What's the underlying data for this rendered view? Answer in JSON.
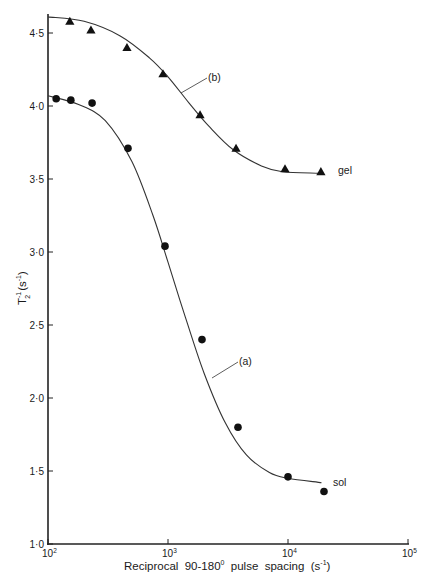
{
  "chart_data": {
    "type": "scatter",
    "title": "",
    "xlabel": "Reciprocal 90-180° pulse spacing (s⁻¹)",
    "xlabel_parts": {
      "main": "Reciprocal  90-180",
      "degree": "0",
      "units_open": "  pulse  spacing  (s",
      "units_exp": "-1",
      "units_close": ")"
    },
    "ylabel": "T₂⁻¹ (s⁻¹)",
    "ylabel_parts": {
      "base": "T",
      "sub": "2",
      "exp": "-1",
      "units": "(s",
      "units_exp": "-1",
      "units_close": ")"
    },
    "xscale": "log",
    "xlim": [
      100,
      100000
    ],
    "ylim": [
      1.0,
      4.6
    ],
    "x_ticks": [
      {
        "value": 100,
        "base": "10",
        "exp": "2"
      },
      {
        "value": 1000,
        "base": "10",
        "exp": "3"
      },
      {
        "value": 10000,
        "base": "10",
        "exp": "4"
      },
      {
        "value": 100000,
        "base": "10",
        "exp": "5"
      }
    ],
    "y_ticks": [
      {
        "value": 1.0,
        "label": "1·0"
      },
      {
        "value": 1.5,
        "label": "1·5"
      },
      {
        "value": 2.0,
        "label": "2·0"
      },
      {
        "value": 2.5,
        "label": "2·5"
      },
      {
        "value": 3.0,
        "label": "3·0"
      },
      {
        "value": 3.5,
        "label": "3·5"
      },
      {
        "value": 4.0,
        "label": "4·0"
      },
      {
        "value": 4.5,
        "label": "4·5"
      }
    ],
    "grid": false,
    "legend": "none",
    "series": [
      {
        "name": "gel",
        "curve_label": "(b)",
        "marker": "triangle",
        "points": [
          {
            "x": 152,
            "y": 4.58
          },
          {
            "x": 228,
            "y": 4.52
          },
          {
            "x": 455,
            "y": 4.4
          },
          {
            "x": 908,
            "y": 4.22
          },
          {
            "x": 1850,
            "y": 3.94
          },
          {
            "x": 3690,
            "y": 3.71
          },
          {
            "x": 9440,
            "y": 3.57
          },
          {
            "x": 18800,
            "y": 3.55
          }
        ],
        "fit_curve": [
          {
            "x": 100,
            "y": 4.61
          },
          {
            "x": 200,
            "y": 4.58
          },
          {
            "x": 400,
            "y": 4.48
          },
          {
            "x": 700,
            "y": 4.33
          },
          {
            "x": 1000,
            "y": 4.2
          },
          {
            "x": 1500,
            "y": 4.02
          },
          {
            "x": 2200,
            "y": 3.86
          },
          {
            "x": 3500,
            "y": 3.7
          },
          {
            "x": 6000,
            "y": 3.59
          },
          {
            "x": 9000,
            "y": 3.55
          },
          {
            "x": 18000,
            "y": 3.54
          }
        ]
      },
      {
        "name": "sol",
        "curve_label": "(a)",
        "marker": "circle",
        "points": [
          {
            "x": 117,
            "y": 4.05
          },
          {
            "x": 155,
            "y": 4.04
          },
          {
            "x": 233,
            "y": 4.02
          },
          {
            "x": 464,
            "y": 3.71
          },
          {
            "x": 944,
            "y": 3.04
          },
          {
            "x": 1920,
            "y": 2.4
          },
          {
            "x": 3830,
            "y": 1.8
          },
          {
            "x": 10000,
            "y": 1.46
          },
          {
            "x": 19950,
            "y": 1.36
          }
        ],
        "fit_curve": [
          {
            "x": 100,
            "y": 4.07
          },
          {
            "x": 180,
            "y": 4.01
          },
          {
            "x": 300,
            "y": 3.9
          },
          {
            "x": 500,
            "y": 3.62
          },
          {
            "x": 750,
            "y": 3.25
          },
          {
            "x": 1000,
            "y": 2.93
          },
          {
            "x": 1400,
            "y": 2.55
          },
          {
            "x": 2000,
            "y": 2.17
          },
          {
            "x": 3000,
            "y": 1.83
          },
          {
            "x": 4500,
            "y": 1.61
          },
          {
            "x": 7000,
            "y": 1.49
          },
          {
            "x": 10000,
            "y": 1.45
          },
          {
            "x": 19000,
            "y": 1.42
          }
        ]
      }
    ],
    "annotations": [
      {
        "text": "(b)",
        "series": "gel"
      },
      {
        "text": "(a)",
        "series": "sol"
      },
      {
        "text": "gel",
        "series": "gel"
      },
      {
        "text": "sol",
        "series": "sol"
      }
    ]
  }
}
